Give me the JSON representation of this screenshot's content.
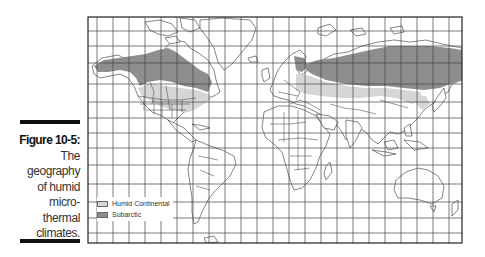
{
  "caption": {
    "figure_label": "Figure 10-5:",
    "lines": [
      "The",
      "geography",
      "of humid",
      "micro-",
      "thermal",
      "climates."
    ]
  },
  "map": {
    "projection": "Mercator-style world map with graticule",
    "frame": {
      "left": 88,
      "top": 17,
      "right": 462,
      "bottom": 243
    },
    "grid": {
      "vertical_spacing_px": 16,
      "horizontal_lines_y": [
        31,
        46,
        63,
        84,
        102,
        118,
        133,
        148,
        165,
        184,
        202,
        218,
        233
      ]
    },
    "colors": {
      "humid_continental": "#d6d6d6",
      "subarctic": "#8e8e8e",
      "land": "#ffffff",
      "outline": "#333333",
      "grid": "#444444"
    },
    "regions": [
      {
        "name": "Subarctic",
        "areas": [
          "Alaska",
          "Northern Canada",
          "Scandinavia",
          "Siberia / Northern Russia"
        ]
      },
      {
        "name": "Humid Continental",
        "areas": [
          "Northeastern United States",
          "Southern Canada",
          "Eastern Europe",
          "Central Russia",
          "Northeastern China / Korea"
        ]
      }
    ]
  },
  "legend": {
    "items": [
      {
        "label": "Humid Continental",
        "color": "#d6d6d6"
      },
      {
        "label": "Subarctic",
        "color": "#8e8e8e"
      }
    ]
  }
}
